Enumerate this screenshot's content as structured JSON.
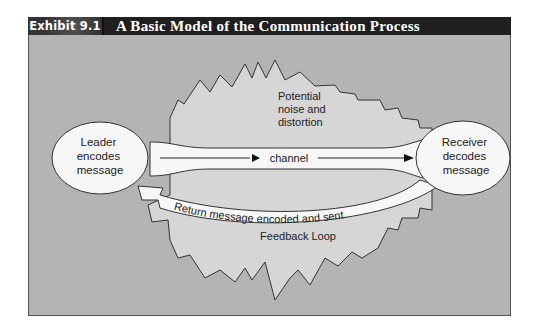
{
  "header": {
    "exhibit_label": "Exhibit 9.1",
    "title": "A Basic Model of the Communication Process"
  },
  "diagram": {
    "noise_label": [
      "Potential",
      "noise and",
      "distortion"
    ],
    "sender": {
      "lines": [
        "Leader",
        "encodes",
        "message"
      ]
    },
    "receiver": {
      "lines": [
        "Receiver",
        "decodes",
        "message"
      ]
    },
    "channel_label": "channel",
    "return_label": "Return message encoded and sent",
    "feedback_label": "Feedback Loop"
  },
  "colors": {
    "title_bar": "#1f1f1f",
    "panel_bg": "#b4b4b4",
    "noise_fill": "#d6d6d6",
    "node_fill": "#f7f7f7",
    "stroke": "#333333"
  }
}
